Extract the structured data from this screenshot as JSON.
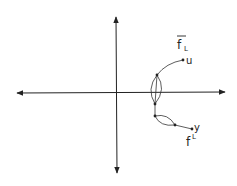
{
  "diagram": {
    "type": "complex-plane-contour",
    "colors": {
      "ink": "#222222",
      "background": "#ffffff"
    },
    "axes": {
      "horizontal": {
        "y": 93,
        "x_start": 15,
        "x_end": 227,
        "arrows": "both"
      },
      "vertical": {
        "x": 116,
        "y_start": 15,
        "y_end": 175,
        "arrows": "both"
      }
    },
    "nodes": [
      {
        "id": "top",
        "x": 157,
        "y": 75
      },
      {
        "id": "mid",
        "x": 155,
        "y": 104
      },
      {
        "id": "low",
        "x": 155,
        "y": 116
      },
      {
        "id": "inner",
        "x": 175,
        "y": 125
      },
      {
        "id": "u",
        "x": 183,
        "y": 60
      },
      {
        "id": "y",
        "x": 192,
        "y": 129
      }
    ],
    "labels": {
      "upper_path": {
        "base": "f",
        "subscript": "L",
        "overbar": true
      },
      "upper_endpoint": "u",
      "lower_endpoint": "y",
      "lower_path": {
        "base": "f",
        "superscript": "L"
      }
    }
  }
}
